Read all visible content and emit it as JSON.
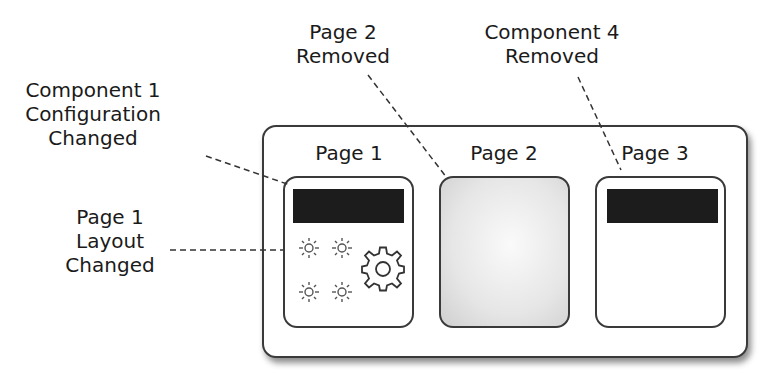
{
  "annotations": {
    "component1": "Component 1\nConfiguration\nChanged",
    "component1_lines": [
      "Component 1",
      "Configuration",
      "Changed"
    ],
    "page1_layout_lines": [
      "Page 1",
      "Layout",
      "Changed"
    ],
    "page2_removed_lines": [
      "Page 2",
      "Removed"
    ],
    "component4_removed_lines": [
      "Component 4",
      "Removed"
    ]
  },
  "app": {
    "pages": [
      {
        "title": "Page 1",
        "state": "modified",
        "components": [
          "black-bar",
          "sun-icon",
          "sun-icon",
          "sun-icon",
          "sun-icon",
          "gear-icon"
        ]
      },
      {
        "title": "Page 2",
        "state": "removed"
      },
      {
        "title": "Page 3",
        "state": "component-removed",
        "components": [
          "black-bar"
        ]
      }
    ]
  },
  "colors": {
    "stroke": "#3a3a3a",
    "component_fill": "#1c1c1c",
    "removed_page_fill": "#e0e0e0"
  }
}
